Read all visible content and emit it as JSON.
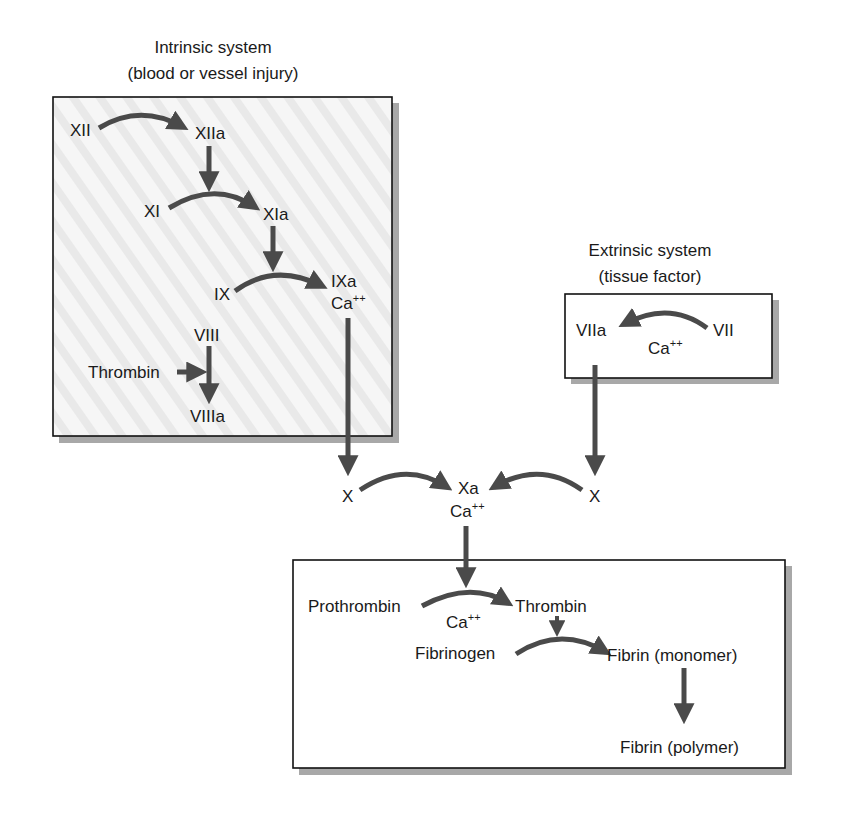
{
  "intrinsic": {
    "title": "Intrinsic system",
    "subtitle": "(blood or vessel injury)",
    "nodes": {
      "xii": "XII",
      "xiia": "XIIa",
      "xi": "XI",
      "xia": "XIa",
      "ix": "IX",
      "ixa": "IXa",
      "ca": "Ca",
      "ca_sup": "++",
      "viii": "VIII",
      "thrombin": "Thrombin",
      "viiia": "VIIIa"
    }
  },
  "extrinsic": {
    "title": "Extrinsic system",
    "subtitle": "(tissue factor)",
    "nodes": {
      "viia": "VIIa",
      "vii": "VII",
      "ca": "Ca",
      "ca_sup": "++"
    }
  },
  "common": {
    "x_left": "X",
    "x_right": "X",
    "xa": "Xa",
    "ca": "Ca",
    "ca_sup": "++"
  },
  "final": {
    "prothrombin": "Prothrombin",
    "thrombin": "Thrombin",
    "ca": "Ca",
    "ca_sup": "++",
    "fibrinogen": "Fibrinogen",
    "fibrin_monomer": "Fibrin (monomer)",
    "fibrin_polymer": "Fibrin (polymer)"
  },
  "colors": {
    "arrow": "#4a4a4a",
    "box_border": "#111111",
    "box_shadow": "#a0a0a0",
    "intrinsic_fill": "#f1f1f1",
    "text": "#1a1a1a"
  }
}
